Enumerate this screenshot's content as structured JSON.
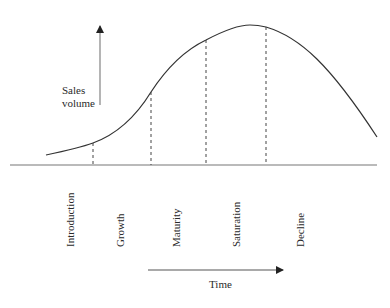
{
  "diagram": {
    "y_axis_label_line1": "Sales",
    "y_axis_label_line2": "volume",
    "x_axis_label": "Time",
    "stages": [
      {
        "label": "Introduction"
      },
      {
        "label": "Growth"
      },
      {
        "label": "Maturity"
      },
      {
        "label": "Saturation"
      },
      {
        "label": "Decline"
      }
    ],
    "colors": {
      "line": "#333333",
      "baseline": "#777777",
      "dashed": "#444444",
      "background": "#ffffff"
    }
  }
}
